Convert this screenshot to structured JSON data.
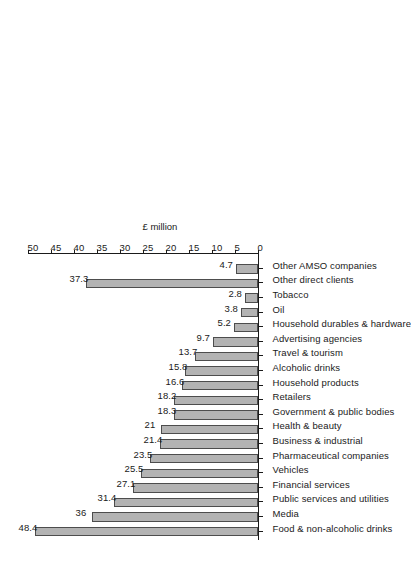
{
  "chart_data": {
    "type": "bar",
    "title": "",
    "subtitle": "",
    "orientation": "vertical-rotated",
    "xlabel": "",
    "ylabel": "£ million",
    "ylim": [
      0,
      50
    ],
    "ytick_step": 5,
    "grid": false,
    "legend": null,
    "tick_labels": [
      "0",
      "5",
      "10",
      "15",
      "20",
      "25",
      "30",
      "35",
      "40",
      "45",
      "50"
    ],
    "categories": [
      "Food & non-alcoholic drinks",
      "Media",
      "Public services and utilities",
      "Financial services",
      "Vehicles",
      "Pharmaceutical companies",
      "Business & industrial",
      "Health & beauty",
      "Government & public bodies",
      "Retailers",
      "Household products",
      "Alcoholic drinks",
      "Travel & tourism",
      "Advertising agencies",
      "Household durables & hardware",
      "Oil",
      "Tobacco",
      "Other direct clients",
      "Other AMSO companies"
    ],
    "values": [
      48.4,
      36,
      31.4,
      27.1,
      25.5,
      23.5,
      21.4,
      21,
      18.3,
      18.2,
      16.6,
      15.8,
      13.7,
      9.7,
      5.2,
      3.8,
      2.8,
      37.3,
      4.7
    ],
    "value_labels": [
      "48.4",
      "36",
      "31.4",
      "27.1",
      "25.5",
      "23.5",
      "21.4",
      "21",
      "18.3",
      "18.2",
      "16.6",
      "15.8",
      "13.7",
      "9.7",
      "5.2",
      "3.8",
      "2.8",
      "37.3",
      "4.7"
    ],
    "colors": {
      "bar_fill": "#b3b3b3",
      "bar_edge": "#4d4d4d",
      "axis": "#1a1a1a",
      "background": "#ffffff",
      "text": "#1a1a1a"
    }
  }
}
